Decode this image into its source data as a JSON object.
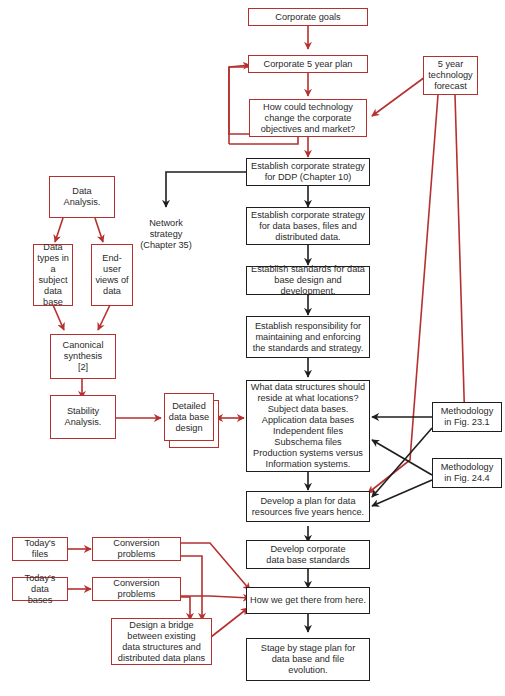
{
  "colors": {
    "red_flow": "#b5312f",
    "black_flow": "#1e1e1e",
    "background": "#ffffff"
  },
  "nodes": {
    "corporate_goals": "Corporate goals",
    "five_year_plan": "Corporate 5 year plan",
    "tech_change": "How could technology\nchange the corporate\nobjectives and market?",
    "tech_forecast": "5 year\ntechnology\nforecast",
    "strategy_ddp": "Establish corporate strategy\nfor DDP (Chapter 10)",
    "network_strategy": "Network\nstrategy\n(Chapter 35)",
    "strategy_databases": "Establish corporate strategy\nfor data bases, files and\ndistributed data.",
    "standards_design": "Establish standards for data\nbase design and development.",
    "responsibility": "Establish responsibility for\nmaintaining and enforcing\nthe standards and strategy.",
    "data_structures": "What data structures should\nreside at what locations?\nSubject data bases.\nApplication data bases\nIndependent files\nSubschema files\nProduction systems versus\nInformation systems.",
    "plan_five_years": "Develop a plan for data\nresources five years hence.",
    "corporate_standards": "Develop corporate\ndata base standards",
    "get_there": "How we get there from here.",
    "stage_plan": "Stage by stage plan for\ndata base and file\nevolution.",
    "data_analysis": "Data Analysis.",
    "data_types": "Data\ntypes in a\nsubject\ndata base",
    "end_user_views": "End-user\nviews of\ndata",
    "canonical_synthesis": "Canonical\nsynthesis\n[2]",
    "stability_analysis": "Stability\nAnalysis.",
    "detailed_design": "Detailed\ndata base\ndesign",
    "methodology_23": "Methodology\nin Fig. 23.1",
    "methodology_24": "Methodology\nin Fig. 24.4",
    "todays_files": "Today's files",
    "conversion_1": "Conversion problems",
    "todays_databases": "Today's data\nbases",
    "conversion_2": "Conversion problems",
    "bridge": "Design a bridge\nbetween existing\ndata structures and\ndistributed data plans"
  }
}
